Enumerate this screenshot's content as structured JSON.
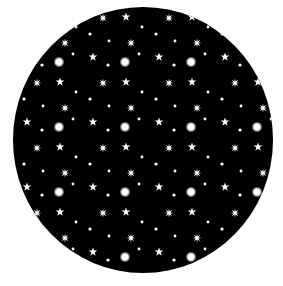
{
  "image": {
    "description": "Black circle filled with a repeating pattern of white stars",
    "background_color": "#ffffff",
    "circle": {
      "cx": 143,
      "cy": 140,
      "rx": 130,
      "ry": 133,
      "fill": "#000000"
    },
    "star_color": "#ffffff",
    "pattern": {
      "tile_width": 66,
      "tile_height": 65,
      "offset_x": 26,
      "offset_y": 30,
      "elements": [
        {
          "type": "burst",
          "x": 33,
          "y": 32,
          "r": 4
        },
        {
          "type": "dot",
          "x": 47,
          "y": 24,
          "r": 1.4
        },
        {
          "type": "star5",
          "x": 1,
          "y": 27,
          "r": 4.5
        },
        {
          "type": "dot",
          "x": 16,
          "y": 35,
          "r": 1.6
        },
        {
          "type": "star8",
          "x": 11,
          "y": 53,
          "r": 4.5
        },
        {
          "type": "star5",
          "x": 34,
          "y": 52,
          "r": 4.5
        },
        {
          "type": "dot",
          "x": 50,
          "y": 62,
          "r": 1.4
        },
        {
          "type": "dot",
          "x": 64,
          "y": 4,
          "r": 1.6
        },
        {
          "type": "star8",
          "x": 39,
          "y": 13,
          "r": 4.5
        },
        {
          "type": "dot",
          "x": 17,
          "y": 11,
          "r": 1.4
        }
      ]
    }
  }
}
